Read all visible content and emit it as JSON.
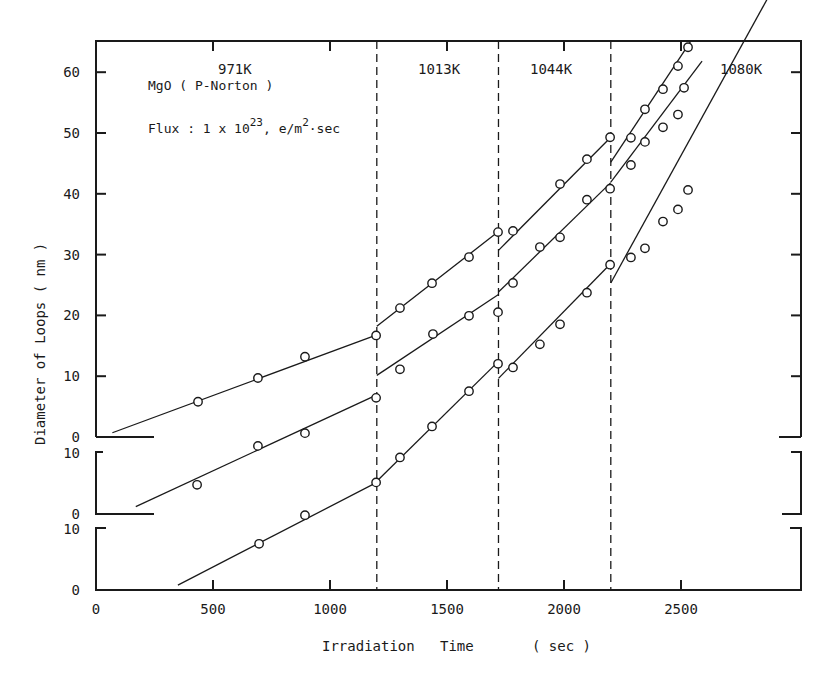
{
  "chart_data": {
    "type": "scatter",
    "title": "",
    "xlabel": "Irradiation Time ( sec )",
    "ylabel": "Diameter of Loops ( nm )",
    "xlim": [
      0,
      3000
    ],
    "x_ticks": [
      0,
      500,
      1000,
      1500,
      2000,
      2500
    ],
    "y_ticks_top_panel": [
      0,
      10,
      20,
      30,
      40,
      50,
      60
    ],
    "y_ticks_middle_panel": [
      0,
      10
    ],
    "y_ticks_bottom_panel": [
      0,
      10
    ],
    "grid": false,
    "annotations": {
      "material": "MgO ( P-Norton )",
      "flux_prefix": "Flux : 1 x 10",
      "flux_exp": "23",
      "flux_unit": "e/m",
      "flux_unit_exp": "2",
      "flux_suffix": "·sec"
    },
    "temperature_boundaries_sec": [
      1200,
      1720,
      2200
    ],
    "temperature_regions": [
      {
        "label": "971K",
        "x_range": [
          0,
          1200
        ]
      },
      {
        "label": "1013K",
        "x_range": [
          1200,
          1720
        ]
      },
      {
        "label": "1044K",
        "x_range": [
          1720,
          2200
        ]
      },
      {
        "label": "1080K",
        "x_range": [
          2200,
          3000
        ]
      }
    ],
    "series": [
      {
        "name": "top",
        "panel_baseline": 0,
        "segments": [
          {
            "region": "971K",
            "x": [
              436,
              692,
              893,
              1197
            ],
            "y": [
              5.8,
              9.7,
              13.2,
              16.7
            ],
            "fit": [
              [
                70,
                0.7
              ],
              [
                1200,
                16.8
              ]
            ]
          },
          {
            "region": "1013K",
            "x": [
              1299,
              1436,
              1594,
              1718
            ],
            "y": [
              21.2,
              25.3,
              29.6,
              33.7
            ],
            "fit": [
              [
                1200,
                18.2
              ],
              [
                1720,
                33.8
              ]
            ]
          },
          {
            "region": "1044K",
            "x": [
              1782,
              1983,
              2098,
              2197
            ],
            "y": [
              33.9,
              41.6,
              45.7,
              49.3
            ],
            "fit": [
              [
                1720,
                30.7
              ],
              [
                2200,
                49.3
              ]
            ]
          },
          {
            "region": "1080K",
            "x": [
              2286,
              2346,
              2423,
              2487,
              2530
            ],
            "y": [
              49.2,
              53.9,
              57.2,
              61.0,
              64.1
            ],
            "fit": [
              [
                2200,
                45.2
              ],
              [
                2540,
                65.0
              ]
            ]
          }
        ]
      },
      {
        "name": "middle",
        "panel_baseline": -12.7,
        "segments": [
          {
            "region": "971K",
            "x": [
              432,
              692,
              893,
              1197
            ],
            "y": [
              4.8,
              11.2,
              13.3,
              19.1
            ],
            "fit": [
              [
                170,
                1.2
              ],
              [
                1200,
                19.6
              ]
            ]
          },
          {
            "region": "1013K",
            "x": [
              1299,
              1440,
              1594,
              1718
            ],
            "y": [
              23.8,
              29.6,
              32.6,
              33.2
            ],
            "fit": [
              [
                1200,
                22.8
              ],
              [
                1720,
                36.1
              ]
            ]
          },
          {
            "region": "1044K",
            "x": [
              1782,
              1897,
              1983,
              2098,
              2197
            ],
            "y": [
              38.0,
              43.9,
              45.5,
              51.7,
              53.5
            ],
            "fit": [
              [
                1720,
                36.5
              ],
              [
                2200,
                54.5
              ]
            ]
          },
          {
            "region": "1080K",
            "x": [
              2286,
              2346,
              2423,
              2487,
              2513
            ],
            "y": [
              57.4,
              61.2,
              63.6,
              65.7,
              70.1
            ],
            "fit": [
              [
                2200,
                54.6
              ],
              [
                2590,
                74.5
              ]
            ]
          }
        ]
      },
      {
        "name": "bottom",
        "panel_baseline": -25.2,
        "segments": [
          {
            "region": "971K",
            "x": [
              697,
              893,
              1197
            ],
            "y": [
              7.6,
              12.3,
              17.7
            ],
            "fit": [
              [
                350,
                0.8
              ],
              [
                1200,
                17.7
              ]
            ]
          },
          {
            "region": "1013K",
            "x": [
              1299,
              1436,
              1594,
              1718
            ],
            "y": [
              21.8,
              26.9,
              32.7,
              37.2
            ],
            "fit": [
              [
                1200,
                17.9
              ],
              [
                1720,
                37.6
              ]
            ]
          },
          {
            "region": "1044K",
            "x": [
              1782,
              1897,
              1983,
              2098,
              2197
            ],
            "y": [
              36.6,
              40.4,
              43.7,
              48.9,
              53.5
            ],
            "fit": [
              [
                1720,
                34.8
              ],
              [
                2200,
                53.7
              ]
            ]
          },
          {
            "region": "1080K",
            "x": [
              2286,
              2346,
              2423,
              2487,
              2530
            ],
            "y": [
              54.7,
              56.2,
              60.6,
              62.6,
              65.8
            ],
            "fit": [
              [
                2200,
                50.5
              ],
              [
                2880,
                98.0
              ]
            ]
          }
        ]
      }
    ]
  },
  "layout": {
    "x0_px": 96,
    "x_scale": 0.234,
    "top_zero_px": 437,
    "y_scale": 6.08,
    "middle_zero_px": 514,
    "bottom_zero_px": 590,
    "plot_right_px": 801,
    "plot_top_px": 41
  }
}
